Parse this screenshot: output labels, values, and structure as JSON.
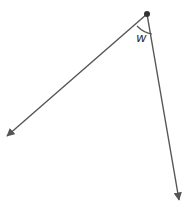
{
  "diagram": {
    "type": "angle",
    "vertex": {
      "x": 147,
      "y": 14
    },
    "rays": [
      {
        "name": "left-ray",
        "end": {
          "x": 6,
          "y": 137
        }
      },
      {
        "name": "right-ray",
        "end": {
          "x": 179,
          "y": 201
        }
      }
    ],
    "angle_label": "w",
    "colors": {
      "line": "#555555",
      "vertex": "#333333"
    }
  }
}
